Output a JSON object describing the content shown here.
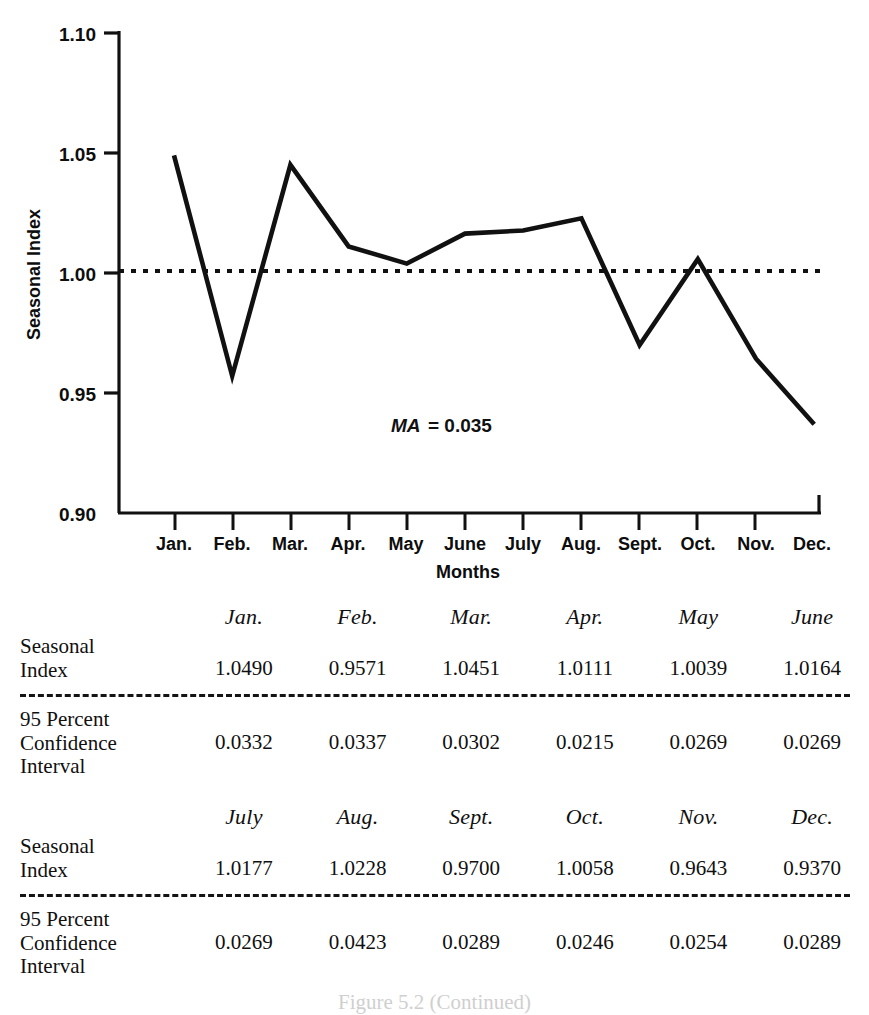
{
  "chart_data": {
    "type": "line",
    "title": "",
    "xlabel": "Months",
    "ylabel": "Seasonal Index",
    "categories": [
      "Jan.",
      "Feb.",
      "Mar.",
      "Apr.",
      "May",
      "June",
      "July",
      "Aug.",
      "Sept.",
      "Oct.",
      "Nov.",
      "Dec."
    ],
    "values": [
      1.049,
      0.9571,
      1.0451,
      1.0111,
      1.0039,
      1.0164,
      1.0177,
      1.0228,
      0.97,
      1.0058,
      0.9643,
      0.937
    ],
    "ylim": [
      0.9,
      1.1
    ],
    "ytick_labels": [
      "1.10",
      "1.05",
      "1.00",
      "0.95",
      "0.90"
    ],
    "ytick_values": [
      1.1,
      1.05,
      1.0,
      0.95,
      0.9
    ],
    "grid": false,
    "legend": "none",
    "reference_line": {
      "value": 1.0,
      "style": "dotted"
    },
    "annotation": {
      "symbol": "MA",
      "equals": "= 0.035",
      "value": 0.035
    }
  },
  "chart": {
    "y_axis_label": "Seasonal Index",
    "x_axis_label": "Months",
    "annotation_symbol": "MA",
    "annotation_value": "= 0.035",
    "line_color": "#111111",
    "axis_color": "#111111"
  },
  "tables": [
    {
      "months": [
        "Jan.",
        "Feb.",
        "Mar.",
        "Apr.",
        "May",
        "June"
      ],
      "seasonal_label_line1": "Seasonal",
      "seasonal_label_line2": "Index",
      "seasonal_values": [
        "1.0490",
        "0.9571",
        "1.0451",
        "1.0111",
        "1.0039",
        "1.0164"
      ],
      "ci_label_line1": "95 Percent",
      "ci_label_line2": "Confidence",
      "ci_label_line3": "Interval",
      "ci_values": [
        "0.0332",
        "0.0337",
        "0.0302",
        "0.0215",
        "0.0269",
        "0.0269"
      ]
    },
    {
      "months": [
        "July",
        "Aug.",
        "Sept.",
        "Oct.",
        "Nov.",
        "Dec."
      ],
      "seasonal_label_line1": "Seasonal",
      "seasonal_label_line2": "Index",
      "seasonal_values": [
        "1.0177",
        "1.0228",
        "0.9700",
        "1.0058",
        "0.9643",
        "0.9370"
      ],
      "ci_label_line1": "95 Percent",
      "ci_label_line2": "Confidence",
      "ci_label_line3": "Interval",
      "ci_values": [
        "0.0269",
        "0.0423",
        "0.0289",
        "0.0246",
        "0.0254",
        "0.0289"
      ]
    }
  ],
  "caption": "Figure 5.2  (Continued)"
}
